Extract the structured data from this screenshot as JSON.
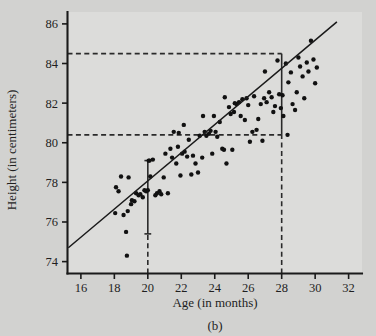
{
  "figure": {
    "caption": "(b)",
    "background_color": "#d2d2d0",
    "plot_background_color": "#dcdcda",
    "ink_color": "#1a1a1a"
  },
  "chart_data": {
    "type": "scatter",
    "title": "",
    "xlabel": "Age (in months)",
    "ylabel": "Height (in centimeters)",
    "xlim": [
      15.2,
      32.8
    ],
    "ylim": [
      73.4,
      86.6
    ],
    "xticks": [
      16,
      18,
      20,
      22,
      24,
      26,
      28,
      30,
      32
    ],
    "yticks": [
      74,
      76,
      78,
      80,
      82,
      84,
      86
    ],
    "xtick_labels": [
      "16",
      "18",
      "20",
      "22",
      "24",
      "26",
      "28",
      "30",
      "32"
    ],
    "ytick_labels": [
      "74",
      "76",
      "78",
      "80",
      "82",
      "84",
      "86"
    ],
    "grid": false,
    "legend": null,
    "marker": "filled-circle",
    "marker_color": "#111111",
    "x": [
      18.05,
      18.1,
      18.25,
      18.4,
      18.55,
      18.7,
      18.75,
      18.8,
      18.85,
      19.0,
      19.05,
      19.2,
      19.3,
      19.45,
      19.55,
      19.7,
      19.8,
      19.9,
      20.0,
      20.05,
      20.15,
      20.3,
      20.45,
      20.55,
      20.7,
      20.8,
      20.95,
      21.05,
      21.2,
      21.35,
      21.45,
      21.55,
      21.7,
      21.8,
      21.95,
      22.05,
      22.2,
      22.35,
      22.45,
      22.6,
      22.7,
      22.85,
      23.0,
      23.1,
      23.25,
      23.4,
      23.5,
      23.65,
      23.75,
      23.85,
      23.95,
      24.05,
      24.15,
      24.3,
      24.45,
      24.55,
      24.7,
      24.85,
      24.95,
      25.05,
      25.15,
      25.3,
      25.45,
      25.55,
      25.65,
      25.8,
      25.9,
      26.0,
      26.1,
      26.25,
      26.35,
      26.5,
      26.6,
      26.75,
      26.85,
      27.0,
      27.1,
      27.25,
      27.4,
      27.5,
      27.6,
      27.75,
      27.85,
      27.95,
      28.05,
      28.1,
      28.25,
      28.4,
      28.55,
      28.65,
      28.8,
      28.9,
      29.0,
      29.1,
      29.25,
      29.35,
      29.5,
      29.6,
      29.75,
      29.9,
      30.0,
      30.1,
      20.1,
      21.85,
      23.3,
      25.2,
      26.95,
      28.35,
      24.6,
      22.15
    ],
    "y": [
      76.45,
      77.75,
      77.55,
      78.3,
      76.35,
      75.5,
      74.3,
      76.55,
      78.25,
      76.9,
      77.1,
      77.05,
      77.45,
      77.35,
      77.4,
      77.25,
      77.6,
      77.55,
      77.6,
      79.1,
      78.3,
      79.15,
      77.35,
      77.45,
      77.55,
      77.4,
      78.25,
      79.45,
      77.45,
      79.7,
      79.25,
      80.55,
      78.95,
      79.8,
      78.35,
      79.45,
      79.55,
      79.3,
      80.15,
      78.4,
      79.35,
      78.95,
      78.5,
      80.35,
      79.25,
      80.55,
      80.35,
      80.45,
      80.6,
      79.45,
      81.35,
      80.55,
      80.3,
      81.05,
      79.7,
      79.65,
      78.95,
      81.8,
      81.45,
      79.65,
      81.55,
      81.95,
      82.05,
      81.35,
      82.2,
      81.15,
      82.25,
      81.9,
      80.05,
      80.55,
      82.35,
      80.65,
      81.2,
      81.95,
      80.1,
      83.6,
      82.05,
      82.55,
      82.3,
      81.55,
      81.85,
      84.15,
      82.45,
      81.75,
      82.4,
      81.35,
      84.0,
      83.05,
      83.55,
      81.95,
      81.65,
      82.55,
      84.3,
      83.85,
      83.35,
      82.25,
      84.05,
      83.6,
      85.15,
      84.2,
      83.0,
      83.8,
      79.1,
      80.5,
      81.35,
      82.0,
      82.25,
      80.4,
      82.3,
      80.9
    ],
    "regression_line": {
      "x": [
        15.25,
        31.3
      ],
      "y": [
        74.7,
        86.1
      ],
      "style": "solid"
    },
    "annotations": [
      {
        "name": "error-bar-at-20",
        "type": "vertical-bar-with-caps",
        "x": 20.0,
        "y_low": 75.4,
        "y_high": 79.1,
        "style": "solid"
      },
      {
        "name": "drop-line-20",
        "type": "vertical-dashed",
        "x": 20.0,
        "y_low": 73.4,
        "y_high": 75.4,
        "style": "dashed"
      },
      {
        "name": "interval-at-28",
        "type": "vertical-bar",
        "x": 28.0,
        "y_low": 80.4,
        "y_high": 84.5,
        "style": "solid"
      },
      {
        "name": "upper-reference-line",
        "type": "horizontal-dashed",
        "y": 84.5,
        "x_start": 15.2,
        "x_end": 28.0,
        "style": "dashed"
      },
      {
        "name": "lower-reference-line",
        "type": "horizontal-dashed",
        "y": 80.4,
        "x_start": 15.2,
        "x_end": 28.0,
        "style": "dashed"
      },
      {
        "name": "drop-line-28",
        "type": "vertical-dashed",
        "x": 28.0,
        "y_low": 73.4,
        "y_high": 80.4,
        "style": "dashed"
      }
    ]
  }
}
